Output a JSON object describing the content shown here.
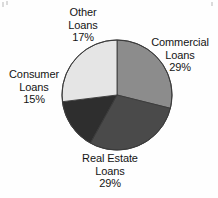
{
  "page": {
    "background_color": "#fefefe",
    "text_color": "#141414"
  },
  "chart_data": {
    "type": "pie",
    "title": "",
    "subtitle": "",
    "xlabel": "",
    "ylabel": "",
    "legend_position": "none",
    "grid": false,
    "units": "percent",
    "start_angle_deg": 0,
    "direction": "clockwise",
    "center": {
      "x": 117,
      "y": 95
    },
    "radius": 55,
    "categories": [
      "Commercial Loans",
      "Real Estate Loans",
      "Consumer Loans",
      "Other Loans"
    ],
    "values": [
      29,
      29,
      15,
      17
    ],
    "total": 90,
    "colors": [
      "#8c8c8c",
      "#4a4a4a",
      "#2e2e2e",
      "#e5e5e5"
    ],
    "slices": [
      {
        "name": "Commercial Loans",
        "label_line1": "Commercial",
        "label_line2": "Loans",
        "value": 29,
        "value_text": "29%",
        "color": "#8c8c8c",
        "start_deg": 0,
        "end_deg": 104,
        "label_position": "right"
      },
      {
        "name": "Real Estate Loans",
        "label_line1": "Real Estate",
        "label_line2": "Loans",
        "value": 29,
        "value_text": "29%",
        "color": "#4a4a4a",
        "start_deg": 104,
        "end_deg": 209,
        "label_position": "bottom"
      },
      {
        "name": "Consumer Loans",
        "label_line1": "Consumer",
        "label_line2": "Loans",
        "value": 15,
        "value_text": "15%",
        "color": "#2e2e2e",
        "start_deg": 209,
        "end_deg": 263,
        "label_position": "left"
      },
      {
        "name": "Other Loans",
        "label_line1": "Other",
        "label_line2": "Loans",
        "value": 17,
        "value_text": "17%",
        "color": "#e5e5e5",
        "start_deg": 263,
        "end_deg": 360,
        "label_position": "top-left"
      }
    ]
  },
  "labels": {
    "other": {
      "line1": "Other",
      "line2": "Loans",
      "percent": "17%"
    },
    "commercial": {
      "line1": "Commercial",
      "line2": "Loans",
      "percent": "29%"
    },
    "consumer": {
      "line1": "Consumer",
      "line2": "Loans",
      "percent": "15%"
    },
    "realestate": {
      "line1": "Real Estate",
      "line2": "Loans",
      "percent": "29%"
    }
  }
}
